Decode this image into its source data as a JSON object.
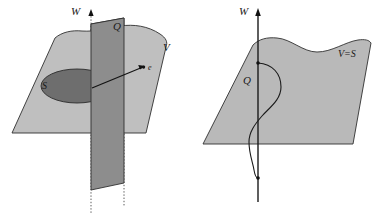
{
  "figure": {
    "title": "",
    "background_color": "#ffffff",
    "width": 386,
    "height": 220,
    "panel_count": 2
  },
  "colors": {
    "plane_v_fill": "#bfbfbf",
    "plane_q_fill": "#8d8d8d",
    "disc_s_fill": "#6e6e6e",
    "plane_vs_fill": "#b9b9b9",
    "outline": "#303030",
    "axis": "#1a1a1a",
    "label": "#1a1a1a"
  },
  "left_panel": {
    "name": "left-diagram",
    "labels": {
      "w_axis": "W",
      "q_plane": "Q",
      "v_plane": "V",
      "s_region": "S",
      "vector_e": "e"
    },
    "elements": {
      "w_axis_style": "dotted-vertical-with-arrow",
      "v_plane_shape": "wavy-edged-parallelogram-horizontal",
      "q_plane_shape": "vertical-rectangle-slab",
      "s_shape": "filled-ellipse",
      "vector_e_shape": "arrow-from-origin-to-point"
    }
  },
  "right_panel": {
    "name": "right-diagram",
    "labels": {
      "w_axis": "W",
      "q_curve": "Q",
      "vs_plane": "V=S"
    },
    "elements": {
      "w_axis_style": "solid-vertical-with-arrow",
      "vs_plane_shape": "wavy-top-edged-parallelogram",
      "q_curve_shape": "s-shaped-curve-crossing-axis",
      "curve_endpoints": 2
    }
  }
}
